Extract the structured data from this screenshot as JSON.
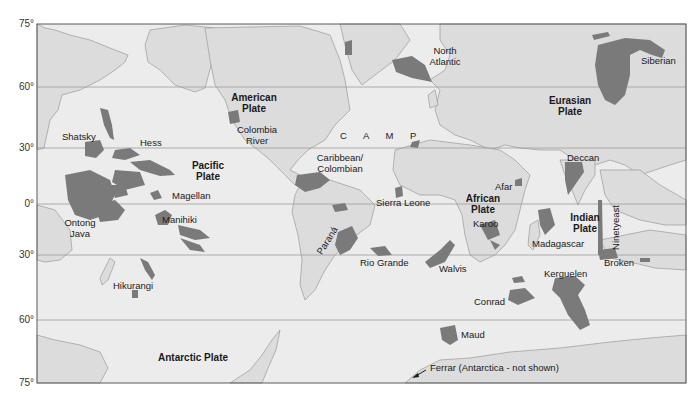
{
  "map": {
    "title": "Large Igneous Provinces and Tectonic Plates",
    "colors": {
      "ocean": "#ececec",
      "land": "#dcdcdc",
      "coast": "#9a9a9a",
      "lip": "#7a7a7a",
      "grid": "#9c9c9c",
      "frame": "#5a5a5a",
      "text": "#1a1a1a"
    },
    "latitude_labels": [
      "75°",
      "60°",
      "30°",
      "0°",
      "30°",
      "60°",
      "75°"
    ],
    "plates": [
      {
        "name_line1": "American",
        "name_line2": "Plate"
      },
      {
        "name_line1": "Pacific",
        "name_line2": "Plate"
      },
      {
        "name_line1": "Eurasian",
        "name_line2": "Plate"
      },
      {
        "name_line1": "African",
        "name_line2": "Plate"
      },
      {
        "name_line1": "Indian",
        "name_line2": "Plate"
      },
      {
        "name_line1": "Antarctic Plate",
        "name_line2": ""
      }
    ],
    "provinces": {
      "shatsky": "Shatsky",
      "hess": "Hess",
      "magellan": "Magellan",
      "manihiki": "Manihiki",
      "ontong_java_1": "Ontong",
      "ontong_java_2": "Java",
      "hikurangi": "Hikurangi",
      "colombia_river_1": "Colombia",
      "colombia_river_2": "River",
      "camp": "C A M P",
      "north_atlantic_1": "North",
      "north_atlantic_2": "Atlantic",
      "caribbean_1": "Caribbean/",
      "caribbean_2": "Colombian",
      "sierra_leone": "Sierra Leone",
      "parana": "Paraná",
      "rio_grande": "Rio Grande",
      "walvis": "Walvis",
      "afar": "Afar",
      "karoo": "Karoo",
      "madagascar": "Madagascar",
      "siberian": "Siberian",
      "deccan": "Deccan",
      "ninetyeast": "Ninetyeast",
      "broken": "Broken",
      "kerguelen": "Kerguelen",
      "conrad": "Conrad",
      "maud": "Maud"
    },
    "annotation": "Ferrar (Antarctica - not shown)"
  }
}
